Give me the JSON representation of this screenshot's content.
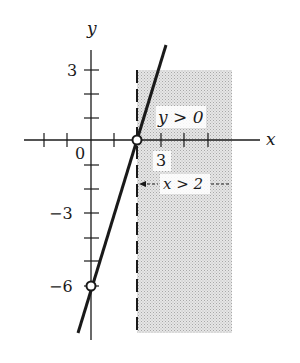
{
  "diagram": {
    "axes": {
      "x_label": "x",
      "y_label": "y",
      "origin_label": "0",
      "x_tick_label": "3",
      "y_tick_labels": {
        "pos3": "3",
        "neg3": "−3",
        "neg6": "−6"
      }
    },
    "annotations": {
      "region_label": "y > 0",
      "arrow_label": "x > 2"
    },
    "line": {
      "equation": "y = 3x - 6",
      "x_intercept": 2,
      "y_intercept": -6
    },
    "shaded_region": "x > 2",
    "colors": {
      "ink": "#1a1a1a",
      "shade": "#d9d9d9",
      "background": "#ffffff"
    }
  }
}
